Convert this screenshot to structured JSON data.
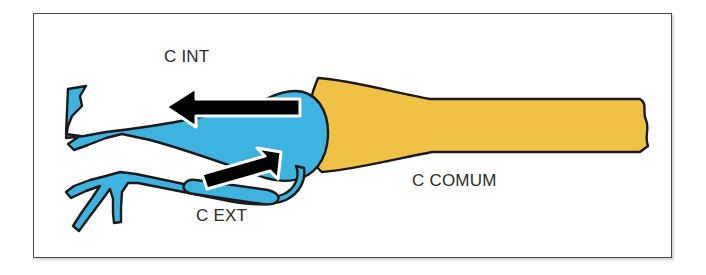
{
  "figure": {
    "type": "anatomical-diagram",
    "background_color": "#ffffff",
    "frame": {
      "border_color": "#4a4a4a",
      "x": 33,
      "y": 13,
      "width": 639,
      "height": 245
    }
  },
  "colors": {
    "internal_external_carotid_blue": "#3FB3E0",
    "common_carotid_yellow": "#EFC145",
    "vessel_outline": "#1a1a1a",
    "arrow_fill": "#000000",
    "arrow_outline": "#ffffff",
    "label_text": "#2b2b2b"
  },
  "labels": [
    {
      "id": "c-int",
      "text": "C INT",
      "x": 164,
      "y": 48,
      "refers_to": "internal-carotid-artery"
    },
    {
      "id": "c-ext",
      "text": "C EXT",
      "x": 196,
      "y": 207,
      "refers_to": "external-carotid-artery"
    },
    {
      "id": "c-comum",
      "text": "C COMUM",
      "x": 412,
      "y": 172,
      "refers_to": "common-carotid-artery"
    }
  ],
  "vessels": [
    {
      "id": "common-carotid",
      "name": "C COMUM",
      "color": "#EFC145",
      "description": "Large yellow trunk running horizontally from the bifurcation at the left to a cut wavy edge at the right margin."
    },
    {
      "id": "internal-carotid",
      "name": "C INT",
      "color": "#3FB3E0",
      "description": "Blue upper branch ascending to the left, ending in a notched cut edge; widened carotid bulb at its origin."
    },
    {
      "id": "external-carotid",
      "name": "C EXT",
      "color": "#3FB3E0",
      "description": "Blue lower branch descending to the left with a forked tip and two small side branches."
    }
  ],
  "arrows": [
    {
      "id": "internal-flow-arrow",
      "direction": "left",
      "fill": "#000000",
      "outline": "#ffffff",
      "description": "Flow arrow inside the internal carotid pointing away from the bifurcation toward the left."
    },
    {
      "id": "external-flow-arrow",
      "direction": "up-right",
      "fill": "#000000",
      "outline": "#ffffff",
      "description": "Flow arrow inside the external carotid pointing up-right toward the bifurcation bulb."
    }
  ]
}
